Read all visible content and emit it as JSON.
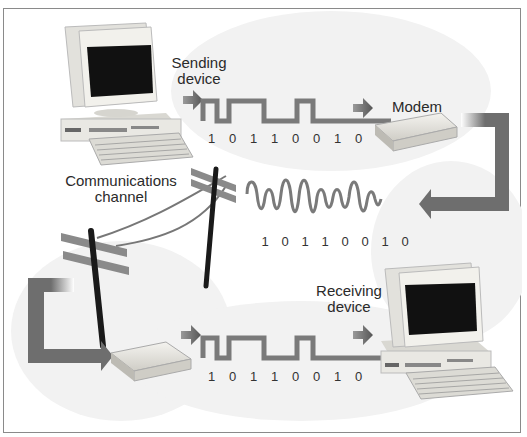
{
  "diagram": {
    "labels": {
      "sending_device": [
        "Sending",
        "device"
      ],
      "modem": "Modem",
      "communications_channel": [
        "Communications",
        "channel"
      ],
      "receiving_device": [
        "Receiving",
        "device"
      ]
    },
    "bit_sequence": "10110010",
    "digital_signal_top": {
      "bits": [
        "1",
        "0",
        "1",
        "1",
        "0",
        "0",
        "1",
        "0"
      ]
    },
    "analog_signal": {
      "bits": [
        "1",
        "0",
        "1",
        "1",
        "0",
        "0",
        "1",
        "0"
      ]
    },
    "digital_signal_bottom": {
      "bits": [
        "1",
        "0",
        "1",
        "1",
        "0",
        "0",
        "1",
        "0"
      ]
    },
    "colors": {
      "signal": "#7a7a7a",
      "arrow": "#6e6e6e",
      "pole": "#1a1a1a",
      "screen": "#111111",
      "device_body": "#ecebe6",
      "frame_border": "#8a8a8a",
      "background_cloud": "#f1f1f1"
    }
  }
}
